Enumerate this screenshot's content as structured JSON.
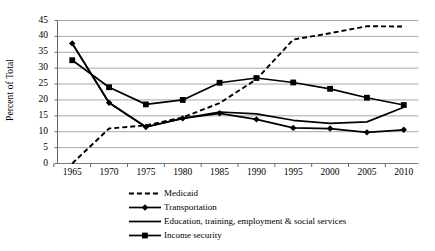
{
  "chart_data": {
    "type": "line",
    "title": "",
    "xlabel": "",
    "ylabel": "Percent of Total",
    "x": [
      1965,
      1970,
      1975,
      1980,
      1985,
      1990,
      1995,
      2000,
      2005,
      2010
    ],
    "xtick_labels": [
      "1965",
      "1970",
      "1975",
      "1980",
      "1985",
      "1990",
      "1995",
      "2000",
      "2005",
      "2010"
    ],
    "ytick_labels": [
      "0",
      "5",
      "10",
      "15",
      "20",
      "25",
      "30",
      "35",
      "40",
      "45"
    ],
    "yticks": [
      0,
      5,
      10,
      15,
      20,
      25,
      30,
      35,
      40,
      45
    ],
    "ylim": [
      0,
      45
    ],
    "xlim": [
      1963,
      2012
    ],
    "grid": "horizontal",
    "legend_position": "bottom",
    "series": [
      {
        "name": "Medicaid",
        "style": "dashed",
        "marker": "none",
        "color": "#000000",
        "values": [
          0.0,
          11.0,
          12.0,
          14.5,
          19.0,
          26.5,
          39.0,
          41.0,
          43.2,
          43.1
        ]
      },
      {
        "name": "Transportation",
        "style": "solid",
        "marker": "diamond",
        "color": "#000000",
        "values": [
          37.8,
          19.1,
          11.5,
          14.2,
          15.8,
          13.9,
          11.2,
          11.0,
          9.8,
          10.6
        ]
      },
      {
        "name": "Education, training, employment & social services",
        "style": "solid",
        "marker": "none",
        "color": "#000000",
        "values": [
          37.8,
          19.1,
          11.5,
          14.2,
          16.2,
          15.6,
          13.6,
          12.6,
          13.1,
          17.7
        ]
      },
      {
        "name": "Income security",
        "style": "solid",
        "marker": "square",
        "color": "#000000",
        "values": [
          32.5,
          24.0,
          18.6,
          20.0,
          25.4,
          26.9,
          25.5,
          23.5,
          20.7,
          18.4
        ]
      }
    ]
  },
  "legend": {
    "items": [
      {
        "label": "Medicaid",
        "key": "dashed-line-key"
      },
      {
        "label": "Transportation",
        "key": "diamond-marker-line-key"
      },
      {
        "label": "Education, training, employment & social services",
        "key": "solid-line-key"
      },
      {
        "label": "Income security",
        "key": "square-marker-line-key"
      }
    ]
  }
}
